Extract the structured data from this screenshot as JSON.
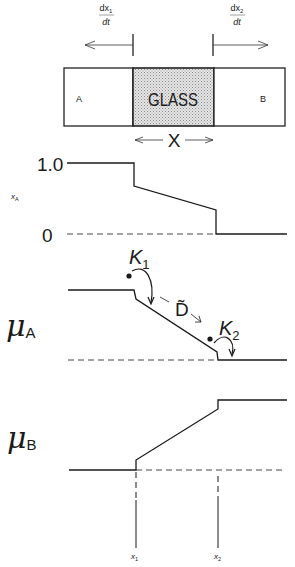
{
  "diagram": {
    "top": {
      "rate_left": {
        "numerator": "dx",
        "sub": "1",
        "denominator": "dt"
      },
      "rate_right": {
        "numerator": "dx",
        "sub": "2",
        "denominator": "dt"
      },
      "region_a_label": "A",
      "glass_label": "GLASS",
      "region_b_label": "B",
      "thickness_label": "X"
    },
    "xa_plot": {
      "axis_label": "x",
      "axis_label_sub": "A",
      "tick_high": "1.0",
      "tick_low": "0"
    },
    "mu_a_plot": {
      "axis_label": "μ",
      "axis_label_sub": "A",
      "k1_label": "K",
      "k1_sub": "1",
      "d_label": "D̃",
      "k2_label": "K",
      "k2_sub": "2"
    },
    "mu_b_plot": {
      "axis_label": "μ",
      "axis_label_sub": "B"
    },
    "positions": {
      "x1_label": "x",
      "x1_sub": "1",
      "x2_label": "x",
      "x2_sub": "2"
    },
    "colors": {
      "line": "#1a1a1a",
      "glass_fill": "#d9d9d9"
    }
  }
}
